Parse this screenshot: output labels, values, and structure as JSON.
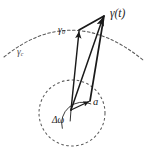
{
  "figure": {
    "background_color": "#ffffff",
    "stroke_color": "#1a1a1a",
    "dashed_color": "#666666",
    "width": 147,
    "height": 151
  },
  "labels": {
    "gamma_t": "γ(t)",
    "gamma_0_base": "γ",
    "gamma_0_sub": "0",
    "gamma_c_base": "γ",
    "gamma_c_sub": "c",
    "a": "a",
    "delta_omega": "Δω"
  },
  "geometry": {
    "curve_arc": {
      "name": "gamma-c-arc",
      "style": "dashed",
      "start": [
        4,
        57
      ],
      "control": [
        72,
        2
      ],
      "end": [
        143,
        60
      ]
    },
    "circle": {
      "name": "base-circle",
      "style": "dashed",
      "center": [
        72,
        113
      ],
      "radius": 33
    },
    "vertex": [
      71,
      110
    ],
    "apex": [
      104,
      16
    ],
    "gamma0_tip": [
      79,
      30
    ],
    "a_tip": [
      90,
      101
    ],
    "angle_arc": {
      "center": [
        71,
        110
      ],
      "radius": 21,
      "start_deg": 260,
      "end_deg": 344
    },
    "vectors": [
      {
        "name": "vector-gamma-t",
        "from": [
          71,
          110
        ],
        "to": [
          104,
          16
        ],
        "arrow": true
      },
      {
        "name": "vector-gamma-0",
        "from": [
          71,
          110
        ],
        "to": [
          79,
          30
        ],
        "arrow": true
      },
      {
        "name": "vector-a",
        "from": [
          71,
          110
        ],
        "to": [
          90,
          101
        ],
        "arrow": true
      },
      {
        "name": "parallelogram-side-left",
        "from": [
          79,
          30
        ],
        "to": [
          104,
          16
        ],
        "arrow": false
      },
      {
        "name": "parallelogram-side-right",
        "from": [
          90,
          101
        ],
        "to": [
          104,
          16
        ],
        "arrow": false
      }
    ]
  }
}
